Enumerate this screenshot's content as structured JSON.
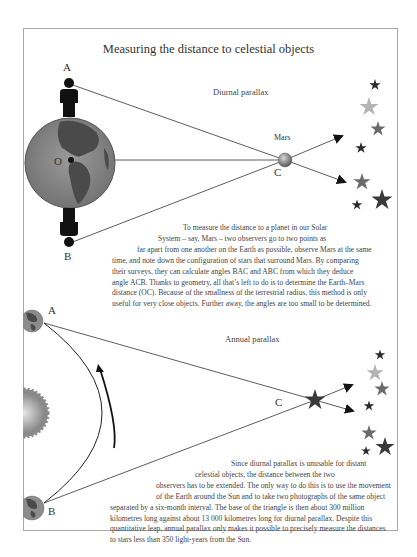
{
  "title": "Measuring the distance to celestial objects",
  "diurnal": {
    "heading": "Diurnal parallax",
    "labels": {
      "a": "A",
      "b": "B",
      "o": "O",
      "c": "C",
      "mars": "Mars"
    },
    "paragraph_lines": [
      "To measure the distance to a planet in our Solar",
      "System – say, Mars – two observers go to  two points as",
      "far apart from one another on the Earth as possible, observe Mars at the same",
      "time, and note down the configuration of stars that surround Mars. By comparing",
      "their surveys, they can calculate angles BAC and ABC from which they deduce",
      "angle ACB. Thanks to geometry, all that’s left to do is to determine the Earth–Mars",
      "distance (OC). Because of the smallness of the terrestrial radius, this method is only",
      "useful for very close objects. Further away, the angles are too small to be determined."
    ],
    "elements": [
      "observer-A",
      "observer-B",
      "earth-globe",
      "earth-center-O",
      "mars-C",
      "background-stars"
    ]
  },
  "annual": {
    "heading": "Annual parallax",
    "labels": {
      "a": "A",
      "b": "B",
      "c": "C"
    },
    "paragraph_lines": [
      "Since diurnal parallax is unusable for distant",
      "celestial objects, the distance between the two",
      "observers has to be extended. The only way to do this is to use the movement",
      "of the Earth around the Sun and to take two photographs of the same object",
      "separated by a six-month interval. The base of the triangle is then about 300 million",
      "kilometres long against about 13 000 kilometres long for diurnal parallax. Despite this",
      "quantitative leap, annual parallax only makes it possible to precisely measure the distances",
      "to stars less than 350 light-years from the Sun."
    ],
    "elements": [
      "earth-position-A",
      "earth-position-B",
      "sun",
      "earth-orbit-arc",
      "star-C",
      "background-stars"
    ]
  },
  "colors": {
    "frame": "#a8a8a8",
    "line": "#333333",
    "silhouette": "#111111",
    "earth_ocean": "#8c8c8c",
    "earth_land": "#4a4a4a",
    "star_dark": "#2b2b2b",
    "star_mid": "#6a6a6a",
    "star_light": "#b4b4b4"
  }
}
